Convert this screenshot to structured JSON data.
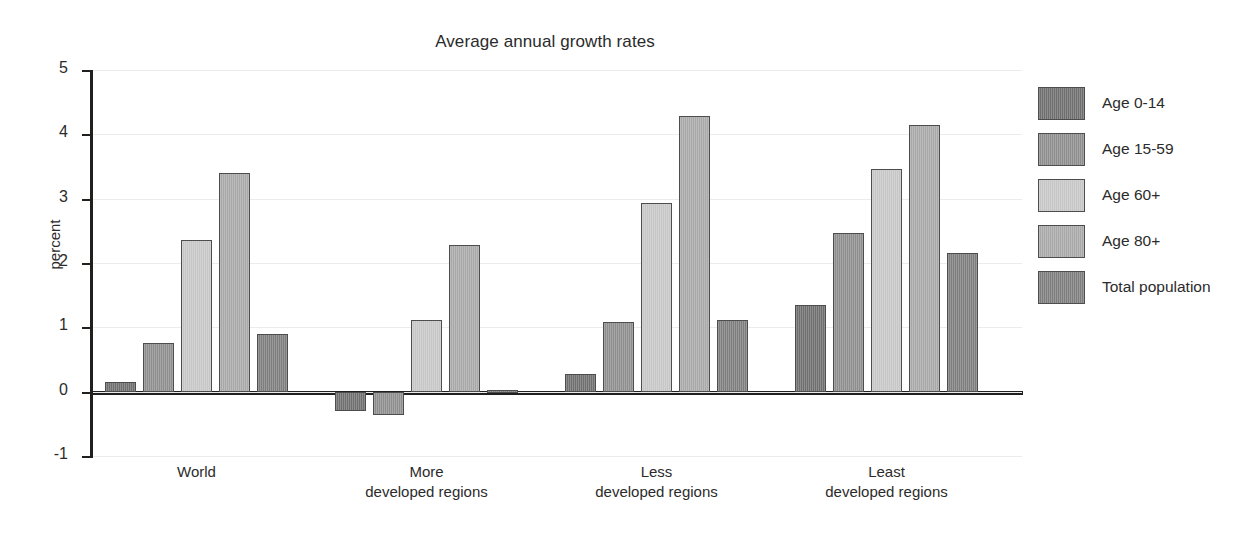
{
  "chart_data": {
    "type": "bar",
    "title": "Average annual growth rates",
    "xlabel": "",
    "ylabel": "percent",
    "ylim": [
      -1,
      5
    ],
    "yticks": [
      5,
      4,
      3,
      2,
      1,
      0,
      -1
    ],
    "ytick_labels": [
      "5",
      "4",
      "3",
      "2",
      "1",
      "0",
      "-1"
    ],
    "grid": true,
    "legend_position": "right",
    "categories": [
      "World",
      "More\ndeveloped regions",
      "Less\ndeveloped regions",
      "Least\ndeveloped regions"
    ],
    "series": [
      {
        "name": "Age 0-14",
        "color": "#6e6e6e",
        "values": [
          0.15,
          -0.3,
          0.28,
          1.35
        ]
      },
      {
        "name": "Age 15-59",
        "color": "#8d8d8d",
        "values": [
          0.76,
          -0.37,
          1.08,
          2.47
        ]
      },
      {
        "name": "Age 60+",
        "color": "#c6c6c6",
        "values": [
          2.35,
          1.11,
          2.94,
          3.46
        ]
      },
      {
        "name": "Age 80+",
        "color": "#a8a8a8",
        "values": [
          3.4,
          2.28,
          4.28,
          4.15
        ]
      },
      {
        "name": "Total population",
        "color": "#7d7d7d",
        "values": [
          0.89,
          0.03,
          1.11,
          2.15
        ]
      }
    ]
  },
  "legend": {
    "items": [
      {
        "label": "Age 0-14"
      },
      {
        "label": "Age 15-59"
      },
      {
        "label": "Age 60+"
      },
      {
        "label": "Age 80+"
      },
      {
        "label": "Total population"
      }
    ]
  },
  "axes": {
    "y_title": "percent"
  },
  "title": "Average annual growth rates"
}
